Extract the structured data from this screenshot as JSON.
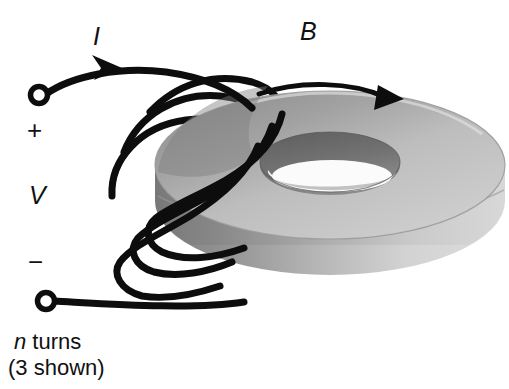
{
  "figure": {
    "labels": {
      "current": "I",
      "field": "B",
      "positive_terminal": "+",
      "voltage": "V",
      "negative_terminal": "−",
      "turns_line1_italic": "n",
      "turns_line1_rest": " turns",
      "turns_line2": "(3 shown)"
    },
    "colors": {
      "background": "#ffffff",
      "wire": "#0d0d0d",
      "torus_top_light": "#c6c6c6",
      "torus_top_shadow": "#8f8f8f",
      "torus_outer_wall_light": "#d9d9d9",
      "torus_outer_wall_dark": "#8a8a8a",
      "torus_inner_wall": "#767676",
      "torus_hole_floor": "#fbfbfb",
      "torus_edge_line": "#6b6b6b",
      "text": "#111111",
      "arrow": "#0d0d0d"
    },
    "geometry": {
      "torus_center_x": 330,
      "torus_center_y": 165,
      "outer_rx": 175,
      "outer_ry": 74,
      "inner_rx": 70,
      "inner_ry": 30,
      "body_height": 86
    },
    "annotations": {
      "turn_count": 3,
      "field_direction": "clockwise",
      "current_direction": "into-coil-right"
    }
  }
}
